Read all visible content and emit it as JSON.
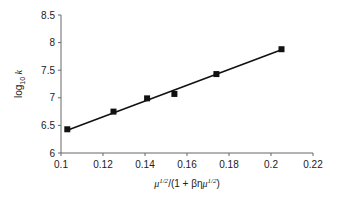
{
  "chart_data": {
    "type": "scatter",
    "title": "",
    "xlabel": "μ^{1/2}/(1 + βημ^{1/2})",
    "ylabel": "log10 k",
    "xlim": [
      0.1,
      0.22
    ],
    "ylim": [
      6,
      8.5
    ],
    "x_ticks": [
      "0.1",
      "0.12",
      "0.14",
      "0.16",
      "0.18",
      "0.2",
      "0.22"
    ],
    "y_ticks": [
      "6",
      "6.5",
      "7",
      "7.5",
      "8",
      "8.5"
    ],
    "grid": false,
    "legend": null,
    "series": [
      {
        "name": "data",
        "marker": "square",
        "x": [
          0.103,
          0.125,
          0.141,
          0.154,
          0.174,
          0.205
        ],
        "y": [
          6.43,
          6.75,
          6.99,
          7.07,
          7.43,
          7.88
        ]
      }
    ],
    "fit_line": {
      "type": "linear",
      "x": [
        0.103,
        0.205
      ],
      "y": [
        6.41,
        7.87
      ]
    }
  },
  "labels": {
    "x_title_main": "μ",
    "x_title_sup1": "1/2",
    "x_title_mid": "/(1 + βη",
    "x_title_mu2": "μ",
    "x_title_sup2": "1/2",
    "x_title_end": ")",
    "y_title_main": "log",
    "y_title_sub": "10",
    "y_title_k": " k"
  }
}
